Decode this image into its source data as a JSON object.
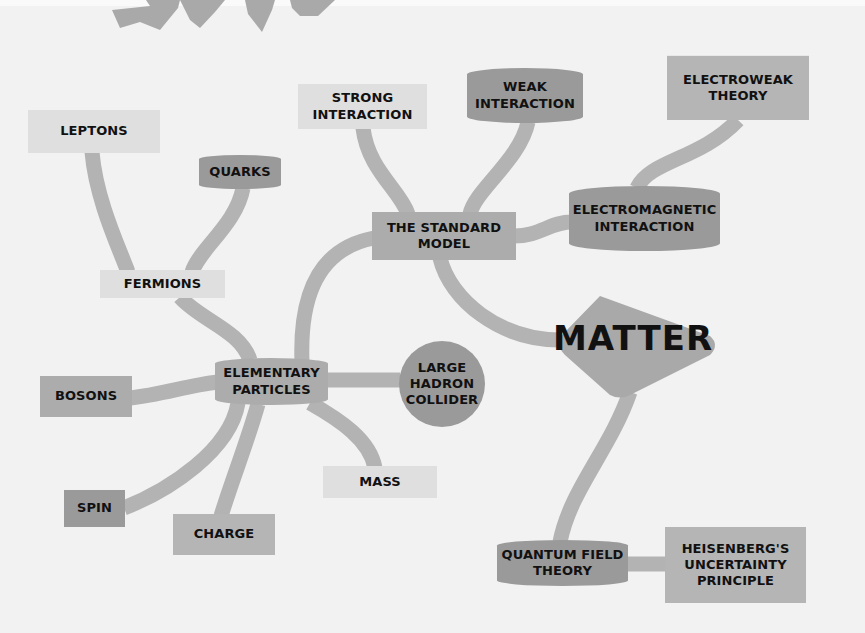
{
  "diagram": {
    "type": "mind-map",
    "central_topic": "MATTER",
    "colors": {
      "background": "#f2f2f2",
      "connector": "#b3b3b3",
      "node_light": "#dfdfdf",
      "node_mid": "#acacac",
      "node_medium": "#b5b5b5",
      "node_dark": "#9a9a9a",
      "text": "#111111"
    },
    "nodes": {
      "matter": "MATTER",
      "standard_model": [
        "THE STANDARD",
        "MODEL"
      ],
      "strong_interaction": [
        "STRONG",
        "INTERACTION"
      ],
      "weak_interaction": [
        "WEAK",
        "INTERACTION"
      ],
      "electromagnetic_interaction": [
        "ELECTROMAGNETIC",
        "INTERACTION"
      ],
      "electroweak_theory": [
        "ELECTROWEAK",
        "THEORY"
      ],
      "elementary_particles": [
        "ELEMENTARY",
        "PARTICLES"
      ],
      "fermions": "FERMIONS",
      "leptons": "LEPTONS",
      "quarks": "QUARKS",
      "bosons": "BOSONS",
      "large_hadron_collider": [
        "LARGE",
        "HADRON",
        "COLLIDER"
      ],
      "mass": "MASS",
      "spin": "SPIN",
      "charge": "CHARGE",
      "quantum_field_theory": [
        "QUANTUM FIELD",
        "THEORY"
      ],
      "heisenberg": [
        "HEISENBERG'S",
        "UNCERTAINTY",
        "PRINCIPLE"
      ]
    },
    "edges": [
      [
        "matter",
        "standard_model"
      ],
      [
        "matter",
        "quantum_field_theory"
      ],
      [
        "standard_model",
        "strong_interaction"
      ],
      [
        "standard_model",
        "weak_interaction"
      ],
      [
        "standard_model",
        "electromagnetic_interaction"
      ],
      [
        "electromagnetic_interaction",
        "electroweak_theory"
      ],
      [
        "standard_model",
        "elementary_particles"
      ],
      [
        "elementary_particles",
        "fermions"
      ],
      [
        "fermions",
        "leptons"
      ],
      [
        "fermions",
        "quarks"
      ],
      [
        "elementary_particles",
        "bosons"
      ],
      [
        "elementary_particles",
        "large_hadron_collider"
      ],
      [
        "elementary_particles",
        "mass"
      ],
      [
        "elementary_particles",
        "spin"
      ],
      [
        "elementary_particles",
        "charge"
      ],
      [
        "quantum_field_theory",
        "heisenberg"
      ]
    ]
  }
}
